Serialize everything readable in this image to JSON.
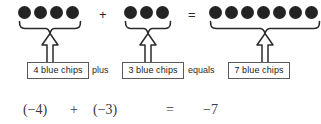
{
  "figure": {
    "chip_color": "#242424",
    "box_border_color": "#5a5a5a",
    "groups": [
      {
        "id": "group-1",
        "chip_count": 4,
        "chip_glyphs": "●●●●",
        "label": "4 blue chips",
        "left": 18,
        "box_left": 27,
        "box_width": 62
      },
      {
        "id": "group-2",
        "chip_count": 3,
        "chip_glyphs": "●●●",
        "label": "3 blue chips",
        "left": 124,
        "box_left": 122,
        "box_width": 62
      },
      {
        "id": "group-3",
        "chip_count": 7,
        "chip_glyphs": "●●●●●●●",
        "label": "7 blue chips",
        "left": 209,
        "box_left": 228,
        "box_width": 62
      }
    ],
    "symbol_operators": [
      {
        "id": "plus-symbol",
        "text": "+",
        "left": 99,
        "top": 8
      },
      {
        "id": "equals-symbol",
        "text": "=",
        "left": 188,
        "top": 8
      }
    ],
    "word_operators": [
      {
        "id": "plus-word",
        "text": "plus",
        "left": 92,
        "top": 66
      },
      {
        "id": "equals-word",
        "text": "equals",
        "left": 188,
        "top": 66
      }
    ],
    "equation": {
      "terms": [
        {
          "id": "term-first",
          "text": "(−4)",
          "left": 23
        },
        {
          "id": "operator-plus",
          "text": "+",
          "left": 70
        },
        {
          "id": "term-second",
          "text": "(−3)",
          "left": 93
        },
        {
          "id": "operator-equals",
          "text": "=",
          "left": 166
        },
        {
          "id": "result",
          "text": "−7",
          "left": 203
        }
      ]
    }
  }
}
